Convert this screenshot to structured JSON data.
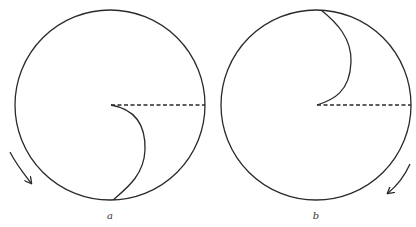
{
  "figure": {
    "panels": [
      {
        "id": "a",
        "label": "a",
        "description": "Rotating disk with curved trace from center to bottom rim; dashed horizontal reference radius to the right; rotation arrow clockwise at lower left",
        "circle": {
          "cx": 110,
          "cy": 105,
          "r": 95
        },
        "reference_line": "dashed",
        "curve_end": "bottom",
        "arrow_direction": "down-right",
        "arrow_position": "lower-left"
      },
      {
        "id": "b",
        "label": "b",
        "description": "Rotating disk with curved trace from center to top rim; dashed horizontal reference radius to the right; rotation arrow at lower right",
        "circle": {
          "cx": 316,
          "cy": 105,
          "r": 95
        },
        "reference_line": "dashed",
        "curve_end": "top",
        "arrow_direction": "down-left",
        "arrow_position": "lower-right"
      }
    ],
    "colors": {
      "stroke": "#2a2a2a",
      "background": "#ffffff"
    }
  }
}
